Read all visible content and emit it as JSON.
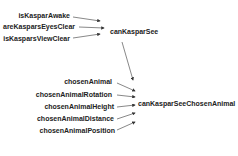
{
  "nodes": {
    "isKasparAwake": "isKasparAwake",
    "areKasparsEyesClear": "areKasparsEyesClear",
    "isKasparsViewClear": "isKasparsViewClear",
    "canKasparSee": "canKasparSee",
    "chosenAnimal": "chosenAnimal",
    "chosenAnimalRotation": "chosenAnimalRotation",
    "chosenAnimalHeight": "chosenAnimalHeight",
    "chosenAnimalDistance": "chosenAnimalDistance",
    "chosenAnimalPosition": "chosenAnimalPosition",
    "canKasparSeeChosenAnimal": "canKasparSeeChosenAnimal"
  },
  "edges": [
    [
      "isKasparAwake",
      "canKasparSee"
    ],
    [
      "areKasparsEyesClear",
      "canKasparSee"
    ],
    [
      "isKasparsViewClear",
      "canKasparSee"
    ],
    [
      "canKasparSee",
      "canKasparSeeChosenAnimal"
    ],
    [
      "chosenAnimal",
      "canKasparSeeChosenAnimal"
    ],
    [
      "chosenAnimalRotation",
      "canKasparSeeChosenAnimal"
    ],
    [
      "chosenAnimalHeight",
      "canKasparSeeChosenAnimal"
    ],
    [
      "chosenAnimalDistance",
      "canKasparSeeChosenAnimal"
    ],
    [
      "chosenAnimalPosition",
      "canKasparSeeChosenAnimal"
    ]
  ]
}
